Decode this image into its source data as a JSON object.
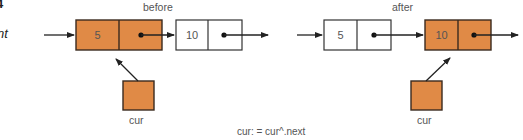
{
  "margin_fragments": {
    "top": "4",
    "middle": "nt"
  },
  "colors": {
    "highlight_fill": "#e08a46",
    "plain_fill": "#ffffff",
    "stroke": "#3a2a1e",
    "arrow": "#222222",
    "text": "#555555"
  },
  "before": {
    "title": "before",
    "nodes": [
      {
        "value": "5",
        "highlighted": true
      },
      {
        "value": "10",
        "highlighted": false
      }
    ],
    "pointer_label": "cur"
  },
  "after": {
    "title": "after",
    "nodes": [
      {
        "value": "5",
        "highlighted": false
      },
      {
        "value": "10",
        "highlighted": true
      }
    ],
    "pointer_label": "cur"
  },
  "caption": "cur: = cur^.next"
}
